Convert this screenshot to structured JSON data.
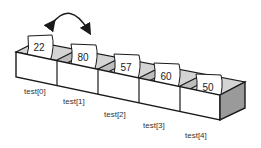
{
  "diagram": {
    "cells": [
      {
        "label": "test[0]",
        "value": "22"
      },
      {
        "label": "test[1]",
        "value": "80"
      },
      {
        "label": "test[2]",
        "value": "57"
      },
      {
        "label": "test[3]",
        "value": "60"
      },
      {
        "label": "test[4]",
        "value": "50"
      }
    ],
    "arrow": {
      "type": "double-headed-curved",
      "from": "test[0]",
      "to": "test[1]"
    },
    "colors": {
      "stroke": "#1a1a1a",
      "inner_shade": "#d0d0d0",
      "side_shade": "#9a9a9a",
      "card": "#ffffff"
    }
  }
}
